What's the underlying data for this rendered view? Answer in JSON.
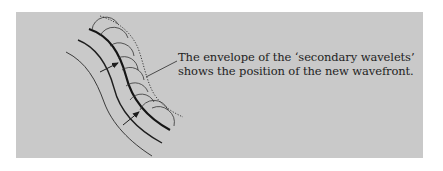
{
  "figure": {
    "background_color": "#c9c9c9",
    "line_color": "#1e1e1e",
    "caption": {
      "line1": "The envelope of the ‘secondary wavelets’",
      "line2": "shows the position of the new wavefront."
    },
    "elements": {
      "old_wavefront_outer": "thin curved line",
      "old_wavefront_inner": "medium curved line",
      "current_wavefront": "thick curved line",
      "secondary_wavelets": "semicircular arcs along thick wavefront",
      "envelope": "dotted line tangent to wavelets (new wavefront)",
      "propagation_arrows": 2
    }
  }
}
